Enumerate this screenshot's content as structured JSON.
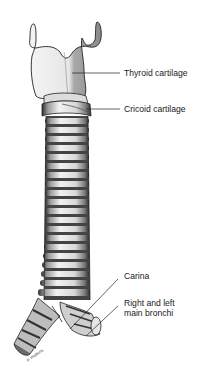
{
  "figure": {
    "labels": {
      "thyroid": "Thyroid cartilage",
      "cricoid": "Cricoid cartilage",
      "carina": "Carina",
      "bronchi_line1": "Right and left",
      "bronchi_line2": "main bronchi"
    },
    "colors": {
      "ink": "#1a1a1a",
      "cartilage_light": "#eeeeee",
      "cartilage_shade": "#9a9a9a",
      "ring_light": "#e8e8e8",
      "ring_dark": "#3a3a3a",
      "background": "#ffffff"
    }
  }
}
